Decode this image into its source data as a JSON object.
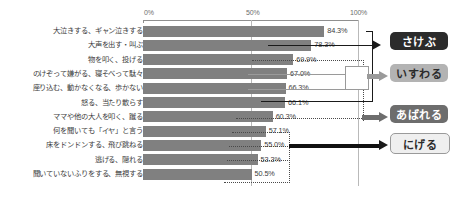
{
  "chart_data": {
    "type": "bar",
    "orientation": "horizontal",
    "title": "",
    "xlabel": "",
    "ylabel": "",
    "xlim": [
      0,
      100
    ],
    "grid": true,
    "legend_position": "right-annotations",
    "axis_ticks": [
      "0%",
      "50%",
      "100%"
    ],
    "axis_tick_values": [
      0,
      50,
      100
    ],
    "categories": [
      "大泣きする、ギャン泣きする",
      "大声を出す・叫ぶ",
      "物を叩く、投げる",
      "のけぞって嫌がる、寝そべって駄々",
      "座り込む、動かなくなる、歩かない",
      "怒る、当たり散らす",
      "ママや他の大人を叩く、蹴る",
      "何を聞いても「イヤ」と言う",
      "床をドンドンする、飛び跳ねる",
      "逃げる、隠れる",
      "聞いていないふりをする、無視する"
    ],
    "values": [
      84.3,
      78.3,
      69.9,
      67.0,
      66.3,
      66.1,
      60.3,
      57.1,
      55.0,
      53.3,
      50.5
    ],
    "value_labels": [
      "84.3%",
      "78.3%",
      "69.9%",
      "67.0%",
      "66.3%",
      "66.1%",
      "60.3%",
      "57.1%",
      "55.0%",
      "53.3%",
      "50.5%"
    ],
    "bar_color": "#808080"
  },
  "annotations": {
    "groups": [
      {
        "label": "さけぶ",
        "style": "dark",
        "bg": "#2b2b2b",
        "fg": "#ffffff"
      },
      {
        "label": "いすわる",
        "style": "light",
        "bg": "#b3b3b3",
        "fg": "#2b2b2b"
      },
      {
        "label": "あばれる",
        "style": "mid",
        "bg": "#6d6d6d",
        "fg": "#ffffff"
      },
      {
        "label": "にげる",
        "style": "outline",
        "bg": "#efefef",
        "fg": "#2b2b2b"
      }
    ]
  }
}
